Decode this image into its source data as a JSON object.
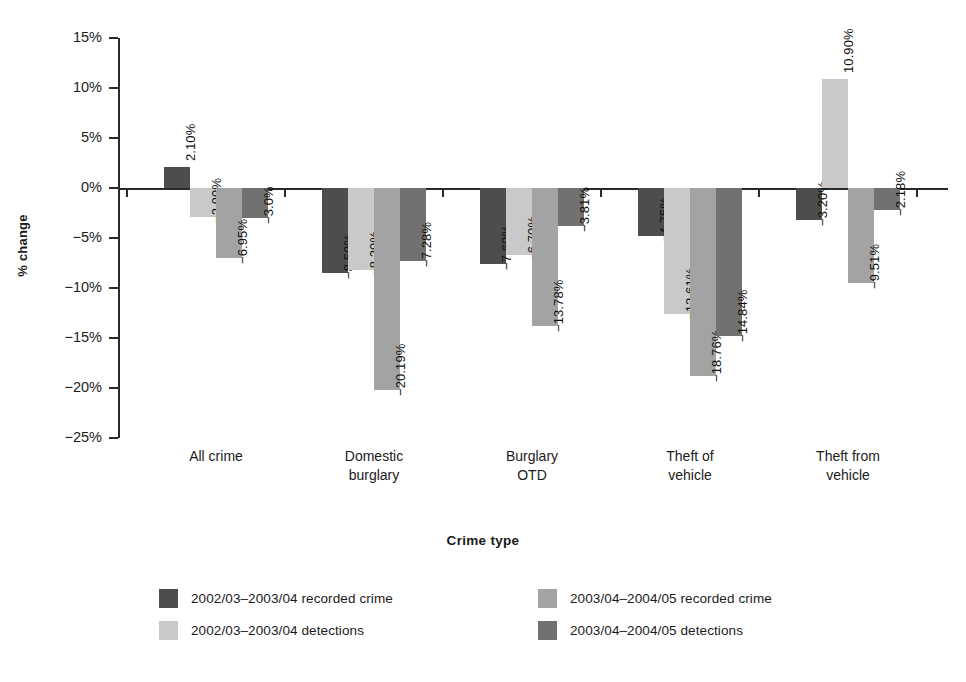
{
  "chart_data": {
    "type": "bar",
    "title": "",
    "xlabel": "Crime type",
    "ylabel": "% change",
    "ylim": [
      -25,
      15
    ],
    "ytick_labels": [
      "15%",
      "10%",
      "5%",
      "0%",
      "−5%",
      "−10%",
      "−15%",
      "−20%",
      "−25%"
    ],
    "ytick_values": [
      15,
      10,
      5,
      0,
      -5,
      -10,
      -15,
      -20,
      -25
    ],
    "grid": false,
    "legend_position": "bottom",
    "categories": [
      "All crime",
      "Domestic burglary",
      "Burglary OTD",
      "Theft of vehicle",
      "Theft from vehicle"
    ],
    "category_lines": [
      [
        "All crime"
      ],
      [
        "Domestic",
        "burglary"
      ],
      [
        "Burglary",
        "OTD"
      ],
      [
        "Theft of",
        "vehicle"
      ],
      [
        "Theft from",
        "vehicle"
      ]
    ],
    "series": [
      {
        "name": "2002/03–2003/04 recorded crime",
        "color": "#4d4d4d",
        "values": [
          2.1,
          -8.5,
          -7.6,
          -4.75,
          -3.2
        ],
        "labels": [
          "2.10%",
          "−8.50%",
          "−7.60%",
          "−4.75%",
          "−3.20%"
        ]
      },
      {
        "name": "2002/03–2003/04 detections",
        "color": "#c9c9c9",
        "values": [
          -2.9,
          -8.2,
          -6.7,
          -12.61,
          10.9
        ],
        "labels": [
          "−2.90%",
          "−8.20%",
          "−6.70%",
          "−12.61%",
          "10.90%"
        ]
      },
      {
        "name": "2003/04–2004/05 recorded crime",
        "color": "#a3a3a3",
        "values": [
          -6.95,
          -20.19,
          -13.78,
          -18.76,
          -9.51
        ],
        "labels": [
          "−6.95%",
          "−20.19%",
          "−13.78%",
          "−18.76%",
          "−9.51%"
        ]
      },
      {
        "name": "2003/04–2004/05 detections",
        "color": "#717171",
        "values": [
          -3.0,
          -7.28,
          -3.81,
          -14.84,
          -2.18
        ],
        "labels": [
          "−3.0%",
          "−7.28%",
          "−3.81%",
          "−14.84%",
          "−2.18%"
        ]
      }
    ]
  },
  "legend": {
    "items": [
      {
        "label": "2002/03–2003/04 recorded crime",
        "color": "#4d4d4d"
      },
      {
        "label": "2003/04–2004/05 recorded crime",
        "color": "#a3a3a3"
      },
      {
        "label": "2002/03–2003/04 detections",
        "color": "#c9c9c9"
      },
      {
        "label": "2003/04–2004/05 detections",
        "color": "#717171"
      }
    ]
  }
}
